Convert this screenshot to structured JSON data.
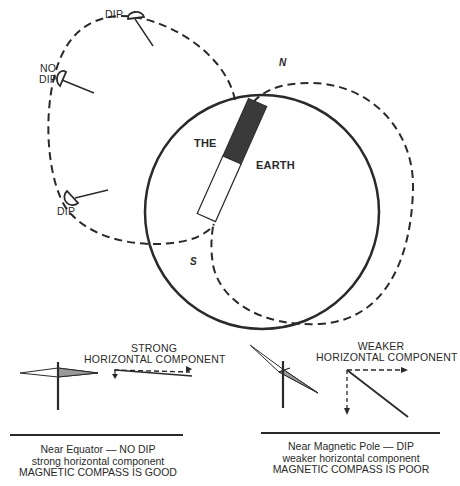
{
  "diagram": {
    "earth": {
      "label_line1": "THE",
      "label_line2": "EARTH",
      "north_label": "N",
      "south_label": "S"
    },
    "field_line_labels": {
      "dip_top": "DIP",
      "no_dip_line1": "NO",
      "no_dip_line2": "DIP",
      "dip_bottom": "DIP"
    },
    "panels": [
      {
        "id": "equator",
        "vector_label_line1": "STRONG",
        "vector_label_line2": "HORIZONTAL COMPONENT",
        "caption_line1": "Near Equator — NO DIP",
        "caption_line2": "strong horizontal component",
        "caption_line3": "MAGNETIC COMPASS IS GOOD"
      },
      {
        "id": "pole",
        "vector_label_line1": "WEAKER",
        "vector_label_line2": "HORIZONTAL COMPONENT",
        "caption_line1": "Near Magnetic Pole — DIP",
        "caption_line2": "weaker horizontal component",
        "caption_line3": "MAGNETIC COMPASS IS POOR"
      }
    ],
    "colors": {
      "ink": "#2a2a2a",
      "magnet_north": "#3a3a3a",
      "needle_shade": "#9a9a9a",
      "background": "#ffffff"
    }
  }
}
